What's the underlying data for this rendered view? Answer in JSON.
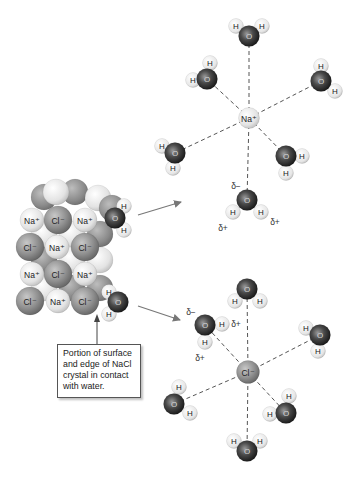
{
  "callout": {
    "text": "Portion of surface and edge of NaCl crystal in contact with water."
  },
  "labels": {
    "na_ion": "Na⁺",
    "cl_ion": "Cl⁻",
    "oxygen": "O",
    "hydrogen": "H",
    "delta_minus": "δ−",
    "delta_plus": "δ+"
  },
  "colors": {
    "na_sphere": "#e6e6e6",
    "cl_sphere": "#8c8c8c",
    "oxygen_sphere": "#3a3a3a",
    "hydrogen_sphere": "#ececec",
    "bond_line": "#555555",
    "arrow": "#777777"
  },
  "crystal": {
    "front_ions": [
      {
        "type": "Na",
        "label": "Na⁺",
        "x": 32,
        "y": 220
      },
      {
        "type": "Cl",
        "label": "Cl⁻",
        "x": 58,
        "y": 220
      },
      {
        "type": "Na",
        "label": "Na⁺",
        "x": 85,
        "y": 220
      },
      {
        "type": "Cl",
        "label": "Cl⁻",
        "x": 30,
        "y": 247
      },
      {
        "type": "Na",
        "label": "Na⁺",
        "x": 57,
        "y": 247
      },
      {
        "type": "Cl",
        "label": "Cl⁻",
        "x": 85,
        "y": 247
      },
      {
        "type": "Na",
        "label": "Na⁺",
        "x": 32,
        "y": 274
      },
      {
        "type": "Cl",
        "label": "Cl⁻",
        "x": 58,
        "y": 274
      },
      {
        "type": "Na",
        "label": "Na⁺",
        "x": 85,
        "y": 274
      },
      {
        "type": "Cl",
        "label": "Cl⁻",
        "x": 30,
        "y": 301
      },
      {
        "type": "Na",
        "label": "Na⁺",
        "x": 58,
        "y": 301
      },
      {
        "type": "Cl",
        "label": "Cl⁻",
        "x": 85,
        "y": 301
      }
    ],
    "surface_waters": [
      {
        "o": [
          115,
          218
        ],
        "h": [
          [
            124,
            206
          ],
          [
            124,
            230
          ]
        ]
      },
      {
        "o": [
          118,
          302
        ],
        "h": [
          [
            109,
            292
          ],
          [
            109,
            314
          ]
        ]
      }
    ]
  },
  "na_hydration": {
    "center": [
      249,
      118
    ],
    "label": "Na⁺",
    "waters": [
      {
        "o": [
          249,
          36
        ],
        "h": [
          [
            236,
            26
          ],
          [
            262,
            26
          ]
        ]
      },
      {
        "o": [
          207,
          79
        ],
        "h": [
          [
            210,
            63
          ],
          [
            193,
            80
          ]
        ]
      },
      {
        "o": [
          321,
          81
        ],
        "h": [
          [
            321,
            66
          ],
          [
            335,
            91
          ]
        ]
      },
      {
        "o": [
          175,
          153
        ],
        "h": [
          [
            162,
            146
          ],
          [
            173,
            168
          ]
        ]
      },
      {
        "o": [
          286,
          156
        ],
        "h": [
          [
            302,
            156
          ],
          [
            286,
            173
          ]
        ]
      },
      {
        "o": [
          247,
          200
        ],
        "h": [
          [
            233,
            212
          ],
          [
            261,
            212
          ]
        ]
      }
    ],
    "deltas": [
      {
        "text": "δ−",
        "x": 236,
        "y": 186
      },
      {
        "text": "δ+",
        "x": 223,
        "y": 228
      },
      {
        "text": "δ+",
        "x": 275,
        "y": 222
      }
    ]
  },
  "cl_hydration": {
    "center": [
      248,
      372
    ],
    "label": "Cl⁻",
    "waters": [
      {
        "o": [
          247,
          289
        ],
        "h": [
          [
            235,
            301
          ],
          [
            260,
            301
          ]
        ]
      },
      {
        "o": [
          205,
          325
        ],
        "h": [
          [
            222,
            324
          ],
          [
            205,
            342
          ]
        ]
      },
      {
        "o": [
          320,
          335
        ],
        "h": [
          [
            306,
            328
          ],
          [
            318,
            351
          ]
        ]
      },
      {
        "o": [
          174,
          404
        ],
        "h": [
          [
            179,
            387
          ],
          [
            190,
            413
          ]
        ]
      },
      {
        "o": [
          286,
          413
        ],
        "h": [
          [
            289,
            396
          ],
          [
            270,
            414
          ]
        ]
      },
      {
        "o": [
          247,
          451
        ],
        "h": [
          [
            234,
            441
          ],
          [
            260,
            441
          ]
        ]
      }
    ],
    "deltas": [
      {
        "text": "δ−",
        "x": 191,
        "y": 312
      },
      {
        "text": "δ+",
        "x": 236,
        "y": 324
      },
      {
        "text": "δ+",
        "x": 200,
        "y": 358
      }
    ]
  }
}
